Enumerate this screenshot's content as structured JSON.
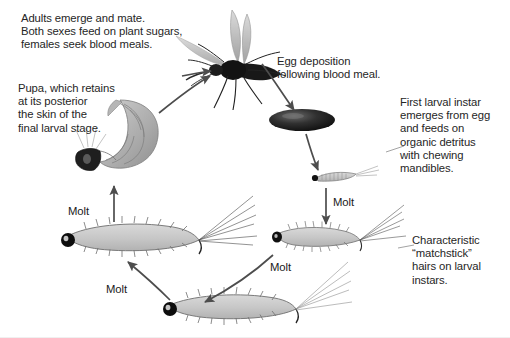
{
  "diagram": {
    "background_color": "#ffffff",
    "text_color": "#262626",
    "arrow_color": "#4d4d4d",
    "larva_body_color": "#c8c8c8",
    "larva_outline_color": "#6e6e6e",
    "egg_color": "#1e1e1e",
    "adult_color": "#1a1a1a",
    "pupa_color": "#a9a9a9"
  },
  "captions": {
    "adult": "Adults emerge and mate.\nBoth sexes feed on plant sugars,\nfemales seek blood meals.",
    "pupa": "Pupa, which retains\nat its posterior\nthe skin of the\nfinal larval stage.",
    "egg": "Egg deposition\nfollowing blood meal.",
    "first_instar": "First larval instar\nemerges from egg\nand feeds on\norganic detritus\nwith chewing\nmandibles.",
    "matchstick": "Characteristic\n“matchstick”\nhairs on larval\ninstars."
  },
  "molt_labels": [
    {
      "id": "molt-egg-to-second",
      "text": "Molt"
    },
    {
      "id": "molt-second-to-third",
      "text": "Molt"
    },
    {
      "id": "molt-third-to-fourth",
      "text": "Molt"
    },
    {
      "id": "molt-fourth-to-pupa",
      "text": "Molt"
    }
  ],
  "stages": [
    {
      "id": "adult-mosquito",
      "name": "Adult mosquito"
    },
    {
      "id": "egg",
      "name": "Egg"
    },
    {
      "id": "first-instar-larva",
      "name": "First instar larva"
    },
    {
      "id": "second-instar-larva",
      "name": "Second instar larva"
    },
    {
      "id": "third-instar-larva",
      "name": "Third instar larva"
    },
    {
      "id": "fourth-instar-larva",
      "name": "Fourth instar larva"
    },
    {
      "id": "pupa",
      "name": "Pupa"
    }
  ]
}
